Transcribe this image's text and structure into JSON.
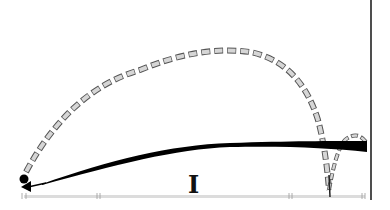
{
  "diagram": {
    "type": "trajectory-illustration",
    "colors": {
      "background": "#ffffff",
      "dashed_fill": "#d6d6d6",
      "dashed_stroke": "#555555",
      "solid_curve": "#000000",
      "ground": "#d9d9d9",
      "wall": "#222222"
    },
    "labels": {
      "marker_I": "I"
    },
    "elements": [
      {
        "name": "launch-point",
        "shape": "dot",
        "x": 24,
        "y": 178
      },
      {
        "name": "dashed-trajectory",
        "style": "dashed-blocks",
        "from": [
          24,
          178
        ],
        "peak": [
          235,
          50
        ],
        "landing": [
          327,
          192
        ]
      },
      {
        "name": "dashed-bounce",
        "style": "dashed-blocks",
        "from": [
          327,
          192
        ],
        "to": [
          368,
          140
        ]
      },
      {
        "name": "solid-trajectory",
        "style": "thick-black-taper",
        "from": [
          24,
          183
        ],
        "to": [
          367,
          148
        ]
      },
      {
        "name": "return-arrow",
        "style": "arrow",
        "tip": [
          22,
          186
        ]
      },
      {
        "name": "ground-line",
        "y": 197,
        "x_from": 22,
        "x_to": 365
      },
      {
        "name": "wall-line",
        "x": 371,
        "y_from": 0,
        "y_to": 200
      },
      {
        "name": "marker-I",
        "x": 190,
        "y": 185
      }
    ]
  }
}
